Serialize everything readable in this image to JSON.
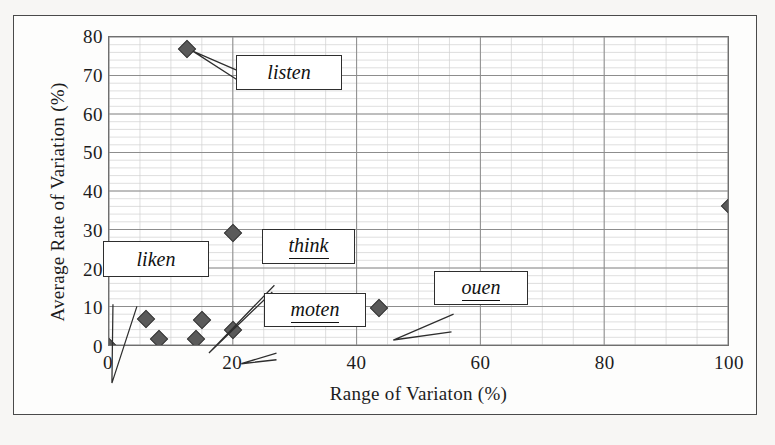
{
  "chart_data": {
    "type": "scatter",
    "title": "",
    "xlabel": "Range of Variaton (%)",
    "ylabel": "Average Rate of Variation (%)",
    "xlim": [
      0,
      100
    ],
    "ylim": [
      0,
      80
    ],
    "xticks": [
      0,
      20,
      40,
      60,
      80,
      100
    ],
    "yticks": [
      0,
      10,
      20,
      30,
      40,
      50,
      60,
      70,
      80
    ],
    "grid": true,
    "minor_grid": true,
    "minor_x_step": 5,
    "minor_y_step": 2,
    "legend": "none",
    "marker": "diamond",
    "marker_color": "#5a5a5a",
    "points": [
      {
        "x": 0.0,
        "y": 0.0,
        "label": "liken"
      },
      {
        "x": 6.0,
        "y": 7.3,
        "label": ""
      },
      {
        "x": 8.0,
        "y": 2.0,
        "label": ""
      },
      {
        "x": 12.5,
        "y": 77.0,
        "label": "listen"
      },
      {
        "x": 14.0,
        "y": 2.0,
        "label": ""
      },
      {
        "x": 15.0,
        "y": 7.0,
        "label": "think"
      },
      {
        "x": 20.0,
        "y": 29.5,
        "label": ""
      },
      {
        "x": 20.0,
        "y": 4.5,
        "label": "moten"
      },
      {
        "x": 43.5,
        "y": 10.0,
        "label": "ouen"
      },
      {
        "x": 100.0,
        "y": 36.5,
        "label": ""
      }
    ],
    "annotations": [
      {
        "text": "listen",
        "italic": true,
        "underline": false,
        "points_to": {
          "x": 12.5,
          "y": 77.0
        }
      },
      {
        "text": "liken",
        "italic": true,
        "underline": false,
        "points_to": {
          "x": 0.0,
          "y": 0.0
        }
      },
      {
        "text": "think",
        "italic": true,
        "underline": true,
        "points_to": {
          "x": 15.0,
          "y": 7.0
        }
      },
      {
        "text": "moten",
        "italic": true,
        "underline": true,
        "points_to": {
          "x": 20.0,
          "y": 4.5
        }
      },
      {
        "text": "ouen",
        "italic": true,
        "underline": true,
        "points_to": {
          "x": 43.5,
          "y": 10.0
        }
      }
    ]
  },
  "axes": {
    "x_title": "Range of Variaton (%)",
    "y_title": "Average Rate of Variation (%)",
    "x_tick_labels": [
      "0",
      "20",
      "40",
      "60",
      "80",
      "100"
    ],
    "y_tick_labels": [
      "0",
      "10",
      "20",
      "30",
      "40",
      "50",
      "60",
      "70",
      "80"
    ]
  },
  "callouts": {
    "listen": "listen",
    "liken": "liken",
    "think": "think",
    "moten": "moten",
    "ouen": "ouen"
  },
  "colors": {
    "marker": "#5a5a5a",
    "marker_edge": "#3d3d3d",
    "major_grid": "#8c8c8c",
    "minor_grid": "#cfcfcf",
    "plot_border": "#6f6f6f",
    "figure_border": "#4a4a4a",
    "text": "#1c1c1c"
  }
}
